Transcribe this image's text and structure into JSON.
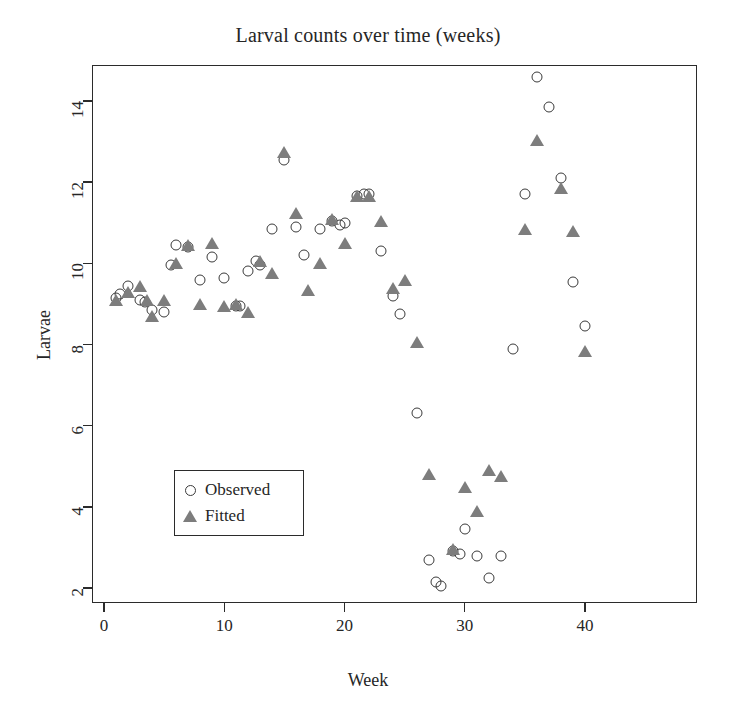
{
  "chart_data": {
    "type": "scatter",
    "title": "Larval counts over time (weeks)",
    "xlabel": "Week",
    "ylabel": "Larvae",
    "xlim": [
      -0.6,
      41.2
    ],
    "ylim": [
      1.45,
      14.95
    ],
    "xticks": [
      0,
      10,
      20,
      30,
      40
    ],
    "yticks": [
      2,
      4,
      6,
      8,
      10,
      12,
      14
    ],
    "grid": false,
    "legend_position": "bottom-left",
    "legend": [
      {
        "label": "Observed",
        "marker": "open-circle",
        "color": "#3a3a3a"
      },
      {
        "label": "Fitted",
        "marker": "filled-triangle",
        "color": "#7d7d7d"
      }
    ],
    "series": [
      {
        "name": "Observed",
        "marker": "open-circle",
        "color": "#3a3a3a",
        "points": [
          [
            1,
            9.15
          ],
          [
            1.3,
            9.25
          ],
          [
            2,
            9.45
          ],
          [
            3,
            9.1
          ],
          [
            3.4,
            9.05
          ],
          [
            4,
            8.85
          ],
          [
            5,
            8.8
          ],
          [
            5.6,
            9.95
          ],
          [
            6,
            10.45
          ],
          [
            7,
            10.4
          ],
          [
            8,
            9.6
          ],
          [
            9,
            10.15
          ],
          [
            10,
            9.65
          ],
          [
            11,
            8.95
          ],
          [
            11.3,
            8.95
          ],
          [
            12,
            9.8
          ],
          [
            12.6,
            10.05
          ],
          [
            13,
            9.95
          ],
          [
            14,
            10.85
          ],
          [
            15,
            12.55
          ],
          [
            16,
            10.9
          ],
          [
            16.6,
            10.2
          ],
          [
            18,
            10.85
          ],
          [
            19,
            11.05
          ],
          [
            19.6,
            10.95
          ],
          [
            20,
            11.0
          ],
          [
            21,
            11.65
          ],
          [
            21.6,
            11.7
          ],
          [
            22,
            11.7
          ],
          [
            23,
            10.3
          ],
          [
            24,
            9.2
          ],
          [
            24.6,
            8.75
          ],
          [
            26,
            6.3
          ],
          [
            27,
            2.7
          ],
          [
            27.6,
            2.15
          ],
          [
            28,
            2.05
          ],
          [
            29,
            2.9
          ],
          [
            29.6,
            2.85
          ],
          [
            30,
            3.45
          ],
          [
            31,
            2.8
          ],
          [
            32,
            2.25
          ],
          [
            33,
            2.8
          ],
          [
            34,
            7.9
          ],
          [
            35,
            11.7
          ],
          [
            36,
            14.6
          ],
          [
            37,
            13.85
          ],
          [
            38,
            12.1
          ],
          [
            39,
            9.55
          ],
          [
            40,
            8.45
          ]
        ]
      },
      {
        "name": "Fitted",
        "marker": "filled-triangle",
        "color": "#7d7d7d",
        "points": [
          [
            1,
            9.1
          ],
          [
            2,
            9.3
          ],
          [
            3,
            9.45
          ],
          [
            3.6,
            9.1
          ],
          [
            4,
            8.7
          ],
          [
            5,
            9.1
          ],
          [
            6,
            10.0
          ],
          [
            7,
            10.45
          ],
          [
            8,
            9.0
          ],
          [
            9,
            10.5
          ],
          [
            10,
            8.95
          ],
          [
            11,
            9.0
          ],
          [
            12,
            8.8
          ],
          [
            13,
            10.05
          ],
          [
            14,
            9.75
          ],
          [
            15,
            12.75
          ],
          [
            16,
            11.25
          ],
          [
            17,
            9.35
          ],
          [
            18,
            10.0
          ],
          [
            19,
            11.1
          ],
          [
            20,
            10.5
          ],
          [
            21,
            11.65
          ],
          [
            22,
            11.65
          ],
          [
            23,
            11.05
          ],
          [
            24,
            9.4
          ],
          [
            25,
            9.6
          ],
          [
            26,
            8.05
          ],
          [
            27,
            4.8
          ],
          [
            29,
            2.95
          ],
          [
            30,
            4.5
          ],
          [
            31,
            3.9
          ],
          [
            32,
            4.9
          ],
          [
            33,
            4.75
          ],
          [
            35,
            10.85
          ],
          [
            36,
            13.05
          ],
          [
            38,
            11.85
          ],
          [
            39,
            10.8
          ],
          [
            40,
            7.85
          ]
        ]
      }
    ]
  },
  "axes": {
    "x_tick_labels": [
      "0",
      "10",
      "20",
      "30",
      "40"
    ],
    "y_tick_labels": [
      "2",
      "4",
      "6",
      "8",
      "10",
      "12",
      "14"
    ]
  }
}
